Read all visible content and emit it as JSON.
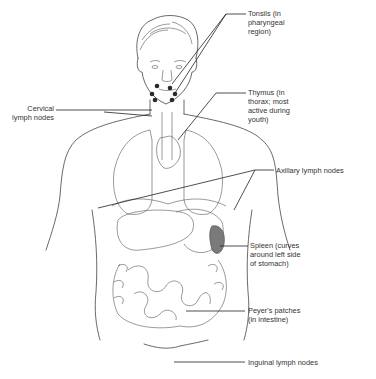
{
  "diagram": {
    "labels": {
      "tonsils": "Tonsils (in\npharyngeal\nregion)",
      "thymus": "Thymus (in\nthorax; most\nactive during\nyouth)",
      "cervical": "Cervical\nlymph nodes",
      "axillary": "Axillary lymph nodes",
      "spleen": "Spleen (curves\naround left side\nof stomach)",
      "peyers": "Peyer's patches\n(in intestine)",
      "inguinal": "Inguinal lymph nodes"
    },
    "colors": {
      "line": "#444444",
      "text": "#333333",
      "spleen_fill": "#7a7a7a",
      "tonsil_fill": "#2a2a2a"
    }
  }
}
